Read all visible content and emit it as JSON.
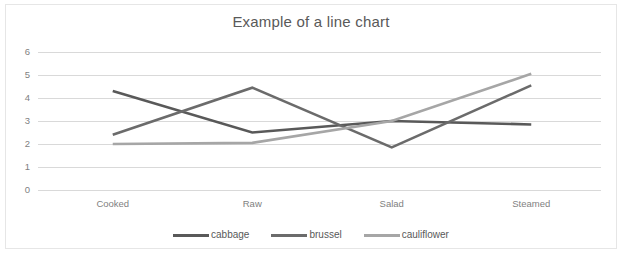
{
  "chart_data": {
    "type": "line",
    "title": "Example of a line chart",
    "xlabel": "",
    "ylabel": "",
    "categories": [
      "Cooked",
      "Raw",
      "Salad",
      "Steamed"
    ],
    "series": [
      {
        "name": "cabbage",
        "values": [
          4.3,
          2.5,
          3.0,
          2.85
        ],
        "color": "#595959"
      },
      {
        "name": "brussel",
        "values": [
          2.4,
          4.45,
          1.85,
          4.55
        ],
        "color": "#6b6b6b"
      },
      {
        "name": "cauliflower",
        "values": [
          2.0,
          2.05,
          3.0,
          5.05
        ],
        "color": "#a6a6a6"
      }
    ],
    "ylim": [
      0,
      6
    ],
    "ytick_labels": [
      "0",
      "1",
      "2",
      "3",
      "4",
      "5",
      "6"
    ],
    "ytick_values": [
      0,
      1,
      2,
      3,
      4,
      5,
      6
    ],
    "grid": true,
    "grid_axis": "y",
    "legend_position": "bottom",
    "legend_entries": [
      "cabbage",
      "brussel",
      "cauliflower"
    ],
    "plot_background": "#ffffff",
    "gridline_color": "#d9d9d9",
    "text_color": "#595959",
    "tick_color": "#7f7f7f",
    "border_color": "#e6e6e6"
  }
}
